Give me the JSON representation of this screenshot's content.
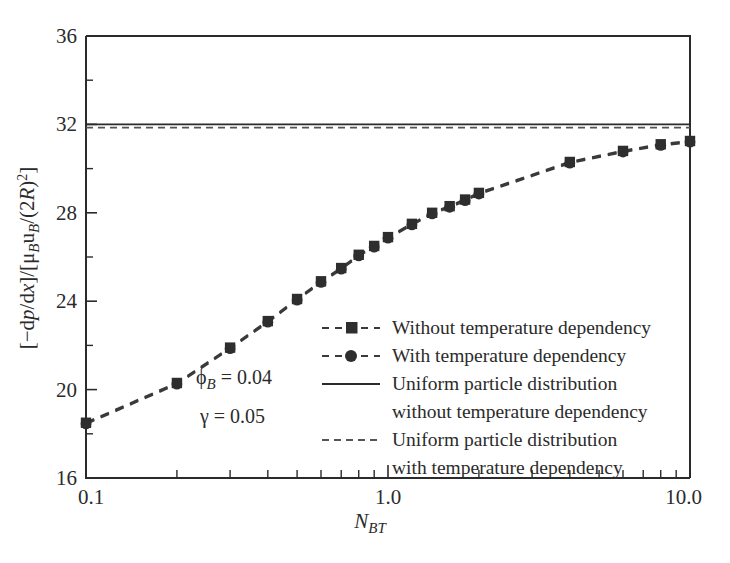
{
  "chart_data": {
    "type": "line",
    "title": "",
    "xlabel": "N_BT",
    "xlabel_parts": {
      "base": "N",
      "sub": "BT"
    },
    "ylabel": "[−dp/dx]/[μ_B u_B/(2R)²]",
    "xscale": "log",
    "xlim": [
      0.1,
      10.0
    ],
    "ylim": [
      16,
      36
    ],
    "yticks": [
      16,
      20,
      24,
      28,
      32,
      36
    ],
    "ytick_labels": [
      "16",
      "20",
      "24",
      "28",
      "32",
      "36"
    ],
    "yticks_minor": [
      18,
      22,
      26,
      30,
      34
    ],
    "xtick_labels": [
      "0.1",
      "1.0",
      "10.0"
    ],
    "xtick_values": [
      0.1,
      1.0,
      10.0
    ],
    "grid": false,
    "legend_position": "center-right",
    "series": [
      {
        "name": "Without temperature dependency",
        "marker": "square",
        "linestyle": "dashed",
        "color": "#2e2e2e",
        "x": [
          0.1,
          0.2,
          0.3,
          0.4,
          0.5,
          0.6,
          0.7,
          0.8,
          0.9,
          1.0,
          1.2,
          1.4,
          1.6,
          1.8,
          2.0,
          4.0,
          6.0,
          8.0,
          10.0
        ],
        "values": [
          18.5,
          20.3,
          21.9,
          23.1,
          24.1,
          24.9,
          25.5,
          26.1,
          26.5,
          26.9,
          27.5,
          28.0,
          28.3,
          28.6,
          28.9,
          30.3,
          30.8,
          31.1,
          31.25
        ]
      },
      {
        "name": "With temperature dependency",
        "marker": "circle",
        "linestyle": "dashed",
        "color": "#2e2e2e",
        "x": [
          0.1,
          0.2,
          0.3,
          0.4,
          0.5,
          0.6,
          0.7,
          0.8,
          0.9,
          1.0,
          1.2,
          1.4,
          1.6,
          1.8,
          2.0,
          4.0,
          6.0,
          8.0,
          10.0
        ],
        "values": [
          18.45,
          20.25,
          21.85,
          23.05,
          24.05,
          24.85,
          25.45,
          26.05,
          26.45,
          26.85,
          27.45,
          27.95,
          28.25,
          28.55,
          28.85,
          30.25,
          30.75,
          31.05,
          31.2
        ]
      }
    ],
    "reference_lines": [
      {
        "name": "Uniform particle distribution without temperature dependency",
        "value": 32.0,
        "linestyle": "solid",
        "color": "#2b2b2b"
      },
      {
        "name": "Uniform particle distribution with temperature dependency",
        "value": 31.85,
        "linestyle": "dashed",
        "color": "#555555"
      }
    ],
    "annotations": [
      {
        "id": "phi-b",
        "base": "ϕ",
        "sub": "B",
        "rest": " = 0.04",
        "x": 0.36,
        "y": 19.1
      },
      {
        "id": "gamma",
        "base": "γ",
        "sub": "",
        "rest": " = 0.05",
        "x": 0.36,
        "y": 17.8
      }
    ]
  },
  "legend": {
    "items": [
      {
        "key": "series-without",
        "label": "Without temperature dependency",
        "label_line2": "",
        "marker": "square",
        "linestyle": "dashed"
      },
      {
        "key": "series-with",
        "label": "With temperature dependency",
        "label_line2": "",
        "marker": "circle",
        "linestyle": "dashed"
      },
      {
        "key": "ref-solid",
        "label": "Uniform particle distribution",
        "label_line2": "without temperature dependency",
        "marker": "none",
        "linestyle": "solid"
      },
      {
        "key": "ref-dashed",
        "label": "Uniform particle distribution",
        "label_line2": "with temperature dependency",
        "marker": "none",
        "linestyle": "dashed"
      }
    ]
  },
  "colors": {
    "axis": "#2b2b2b",
    "marker": "#2e2e2e",
    "series_line": "#3a3a3a",
    "ref_dashed": "#555555",
    "background": "#ffffff"
  }
}
